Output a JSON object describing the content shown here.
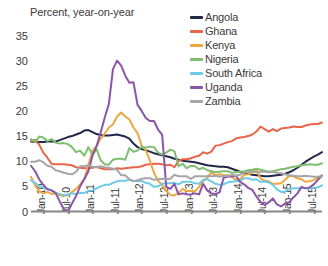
{
  "chart_data": {
    "type": "line",
    "title": "Percent, year-on-year",
    "xlabel": "",
    "ylabel": "",
    "ylim": [
      0,
      35
    ],
    "yticks": [
      0,
      5,
      10,
      15,
      20,
      25,
      30,
      35
    ],
    "grid": false,
    "legend_position": "top-right",
    "x_tick_labels": [
      "Jan-10",
      "Jul-10",
      "Jan-11",
      "Jul-11",
      "Jan-12",
      "Jul-12",
      "Jan-13",
      "Jul-13",
      "Jan-14",
      "Jul-14",
      "Jan-15",
      "Jul-15"
    ],
    "x_start": "Jan-10",
    "x_end": "Dec-15",
    "x_count": 72,
    "series": [
      {
        "name": "Angola",
        "color": "#22284a",
        "values": [
          13.9,
          13.8,
          13.8,
          13.8,
          13.9,
          13.9,
          13.9,
          14.2,
          14.5,
          14.8,
          15.0,
          15.3,
          15.6,
          16.1,
          16.2,
          15.8,
          15.4,
          15.2,
          15.1,
          15.1,
          15.2,
          15.3,
          15.1,
          14.9,
          14.5,
          13.5,
          12.8,
          12.4,
          12.2,
          11.9,
          11.6,
          11.4,
          11.2,
          11.0,
          10.8,
          10.5,
          10.3,
          10.1,
          10.0,
          9.9,
          9.8,
          9.6,
          9.4,
          9.2,
          9.1,
          9.0,
          8.9,
          8.9,
          8.8,
          8.5,
          8.2,
          7.9,
          7.7,
          7.5,
          7.3,
          7.2,
          7.1,
          7.0,
          7.0,
          7.1,
          7.2,
          7.3,
          7.5,
          7.8,
          8.2,
          8.7,
          9.3,
          9.9,
          10.4,
          10.9,
          11.3,
          11.8
        ]
      },
      {
        "name": "Ghana",
        "color": "#e8654a",
        "values": [
          14.0,
          14.2,
          13.3,
          11.7,
          10.7,
          9.5,
          9.4,
          9.4,
          9.4,
          9.3,
          9.2,
          8.8,
          8.7,
          8.6,
          8.6,
          8.7,
          8.9,
          8.6,
          8.4,
          8.4,
          8.4,
          8.6,
          8.5,
          8.6,
          8.7,
          8.8,
          8.8,
          9.0,
          9.3,
          9.4,
          9.5,
          9.5,
          9.4,
          9.2,
          9.3,
          8.8,
          10.1,
          10.4,
          10.4,
          10.6,
          10.9,
          11.1,
          11.8,
          11.5,
          11.9,
          13.1,
          13.2,
          13.5,
          13.8,
          14.0,
          14.5,
          14.7,
          14.8,
          15.0,
          15.3,
          15.9,
          16.9,
          16.4,
          15.9,
          16.4,
          16.0,
          16.5,
          16.6,
          16.7,
          16.9,
          16.8,
          16.8,
          17.1,
          17.3,
          17.4,
          17.4,
          17.7
        ]
      },
      {
        "name": "Kenya",
        "color": "#eda740",
        "values": [
          6.9,
          5.2,
          4.0,
          3.6,
          3.9,
          3.5,
          3.6,
          3.2,
          3.2,
          3.2,
          3.9,
          4.5,
          5.4,
          6.5,
          9.2,
          12.1,
          13.0,
          14.5,
          15.5,
          16.7,
          17.3,
          18.9,
          19.7,
          18.9,
          18.3,
          16.7,
          15.6,
          13.1,
          12.2,
          10.1,
          7.7,
          6.1,
          5.3,
          4.1,
          3.3,
          3.2,
          3.7,
          4.5,
          4.1,
          4.1,
          4.0,
          4.9,
          6.0,
          6.7,
          7.8,
          7.2,
          7.4,
          7.2,
          7.2,
          6.9,
          6.3,
          6.4,
          7.3,
          7.4,
          7.7,
          8.4,
          6.6,
          6.1,
          6.0,
          5.5,
          5.5,
          5.6,
          6.3,
          7.1,
          7.0,
          6.6,
          6.4,
          5.9,
          6.0,
          6.3,
          6.7,
          7.2
        ]
      },
      {
        "name": "Nigeria",
        "color": "#7dbf6e",
        "values": [
          14.4,
          13.8,
          14.9,
          14.7,
          14.0,
          14.4,
          13.7,
          13.5,
          13.6,
          13.4,
          12.8,
          11.8,
          12.1,
          11.1,
          12.8,
          11.3,
          12.4,
          10.2,
          9.4,
          9.3,
          10.3,
          10.5,
          10.5,
          10.3,
          12.6,
          11.9,
          12.1,
          12.9,
          12.7,
          12.9,
          12.8,
          11.7,
          11.3,
          11.7,
          12.3,
          12.0,
          9.0,
          9.5,
          8.6,
          9.1,
          9.0,
          8.4,
          8.7,
          8.2,
          8.0,
          7.8,
          7.9,
          8.0,
          8.0,
          7.7,
          7.8,
          7.9,
          8.0,
          8.2,
          8.3,
          8.5,
          8.3,
          8.1,
          7.9,
          8.0,
          8.2,
          8.4,
          8.5,
          8.7,
          8.9,
          9.0,
          9.2,
          9.3,
          9.4,
          9.3,
          9.3,
          9.6
        ]
      },
      {
        "name": "South Africa",
        "color": "#6ecbe8",
        "values": [
          6.2,
          5.7,
          5.1,
          4.8,
          4.6,
          4.2,
          3.7,
          3.5,
          3.2,
          3.4,
          3.6,
          3.5,
          3.7,
          3.7,
          4.1,
          4.2,
          4.6,
          5.0,
          5.3,
          5.3,
          5.7,
          6.0,
          6.1,
          6.1,
          6.3,
          6.1,
          6.0,
          6.1,
          5.7,
          5.5,
          4.9,
          5.0,
          5.5,
          5.6,
          5.6,
          5.7,
          5.4,
          5.9,
          5.9,
          5.9,
          5.6,
          5.5,
          6.3,
          6.4,
          6.0,
          5.5,
          5.3,
          5.4,
          5.8,
          5.9,
          6.0,
          6.1,
          6.6,
          6.6,
          6.3,
          6.4,
          5.9,
          5.9,
          5.8,
          5.3,
          4.4,
          3.9,
          4.0,
          4.5,
          4.6,
          4.6,
          4.7,
          4.6,
          4.6,
          4.7,
          4.8,
          5.2
        ]
      },
      {
        "name": "Uganda",
        "color": "#8b55a8",
        "values": [
          9.1,
          8.0,
          6.4,
          5.3,
          4.4,
          4.2,
          3.7,
          2.0,
          0.5,
          0.0,
          1.6,
          3.1,
          5.0,
          6.4,
          8.0,
          11.1,
          13.0,
          15.7,
          18.7,
          21.4,
          28.3,
          30.0,
          29.0,
          27.0,
          25.6,
          25.7,
          21.2,
          20.0,
          18.6,
          18.0,
          18.0,
          16.3,
          15.3,
          4.9,
          4.5,
          5.5,
          3.4,
          3.6,
          3.4,
          3.4,
          3.6,
          3.4,
          5.5,
          4.2,
          3.6,
          3.5,
          3.8,
          6.7,
          6.9,
          7.0,
          7.1,
          5.9,
          5.4,
          4.7,
          4.3,
          3.0,
          1.9,
          1.3,
          1.8,
          2.6,
          1.4,
          1.0,
          1.6,
          1.8,
          2.8,
          3.6,
          4.9,
          4.6,
          4.8,
          5.4,
          6.3,
          7.1
        ]
      },
      {
        "name": "Zambia",
        "color": "#a6a6a6",
        "values": [
          9.9,
          9.9,
          10.2,
          9.8,
          9.1,
          8.9,
          8.2,
          8.0,
          7.7,
          7.5,
          7.4,
          7.9,
          9.0,
          9.0,
          9.2,
          8.9,
          8.8,
          9.0,
          8.8,
          8.7,
          8.5,
          8.3,
          7.2,
          7.2,
          6.4,
          6.0,
          6.2,
          6.5,
          6.6,
          6.6,
          6.3,
          6.4,
          6.5,
          6.4,
          6.5,
          7.3,
          7.0,
          7.0,
          7.0,
          6.5,
          7.0,
          7.0,
          7.0,
          7.0,
          7.0,
          7.1,
          6.9,
          7.1,
          7.0,
          7.3,
          7.1,
          7.3,
          7.8,
          7.8,
          8.0,
          7.8,
          7.9,
          7.9,
          7.8,
          7.9,
          7.7,
          7.6,
          7.4,
          7.2,
          7.1,
          7.0,
          7.0,
          7.1,
          7.0,
          6.9,
          6.9,
          7.0
        ]
      }
    ]
  }
}
